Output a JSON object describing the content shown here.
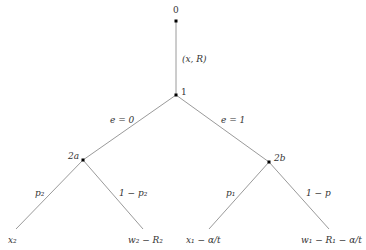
{
  "diagram": {
    "type": "game-tree",
    "nodes": [
      {
        "id": "0",
        "label": "0",
        "x": 176,
        "y": 21
      },
      {
        "id": "1",
        "label": "1",
        "x": 176,
        "y": 95
      },
      {
        "id": "2a",
        "label": "2a",
        "x": 83,
        "y": 160
      },
      {
        "id": "2b",
        "label": "2b",
        "x": 269,
        "y": 162
      }
    ],
    "edges": [
      {
        "from": "0",
        "to": "1",
        "label": "(x, R)"
      },
      {
        "from": "1",
        "to": "2a",
        "label": "e = 0"
      },
      {
        "from": "1",
        "to": "2b",
        "label": "e = 1"
      },
      {
        "from": "2a",
        "to": "x2",
        "label": "p₂"
      },
      {
        "from": "2a",
        "to": "w2R2",
        "label": "1 − p₂"
      },
      {
        "from": "2b",
        "to": "x1",
        "label": "p₁"
      },
      {
        "from": "2b",
        "to": "w1R1",
        "label": "1 − p"
      }
    ],
    "leaves": [
      {
        "id": "x2",
        "label": "x₂"
      },
      {
        "id": "w2R2",
        "label": "w₂ − R₂"
      },
      {
        "id": "x1",
        "label": "x₁ − α/t"
      },
      {
        "id": "w1R1",
        "label": "w₁ − R₁ − α/t"
      }
    ]
  }
}
